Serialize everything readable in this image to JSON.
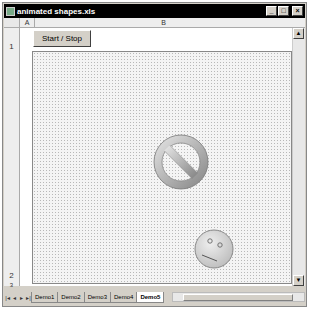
{
  "window": {
    "title": "animated shapes.xls",
    "controls": {
      "minimize": "_",
      "maximize": "□",
      "close": "×"
    }
  },
  "grid": {
    "columns": [
      "A",
      "B"
    ],
    "rows": [
      "1",
      "2",
      "3"
    ]
  },
  "sheet": {
    "start_stop_label": "Start / Stop",
    "shapes": [
      {
        "type": "no-symbol",
        "name": "prohibited-shape"
      },
      {
        "type": "smiley-face",
        "name": "face-shape"
      }
    ]
  },
  "tabs": {
    "nav": [
      "|◂",
      "◂",
      "▸",
      "▸|"
    ],
    "items": [
      {
        "label": "Demo1",
        "active": false
      },
      {
        "label": "Demo2",
        "active": false
      },
      {
        "label": "Demo3",
        "active": false
      },
      {
        "label": "Demo4",
        "active": false
      },
      {
        "label": "Demo5",
        "active": true
      }
    ]
  },
  "colors": {
    "titlebar": "#000000",
    "chrome": "#d4d0c8",
    "canvas_dots": "#b8b8b8"
  }
}
